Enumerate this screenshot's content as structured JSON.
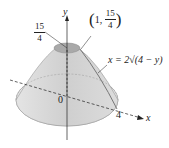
{
  "figure": {
    "axes": {
      "y_label": "y",
      "x_label": "x",
      "origin_label": "0"
    },
    "labels": {
      "top_height": {
        "numerator": "15",
        "denominator": "4"
      },
      "point": {
        "x": "1",
        "y_numerator": "15",
        "y_denominator": "4",
        "prefix": "(1,",
        "suffix": ")"
      },
      "curve_equation": "x = 2√(4 − y)",
      "x_intercept": "4"
    },
    "colors": {
      "surface": "#d9d9d9",
      "top_cap": "#a9a9a9",
      "base": "#e6e6e6",
      "axis": "#222222"
    }
  }
}
